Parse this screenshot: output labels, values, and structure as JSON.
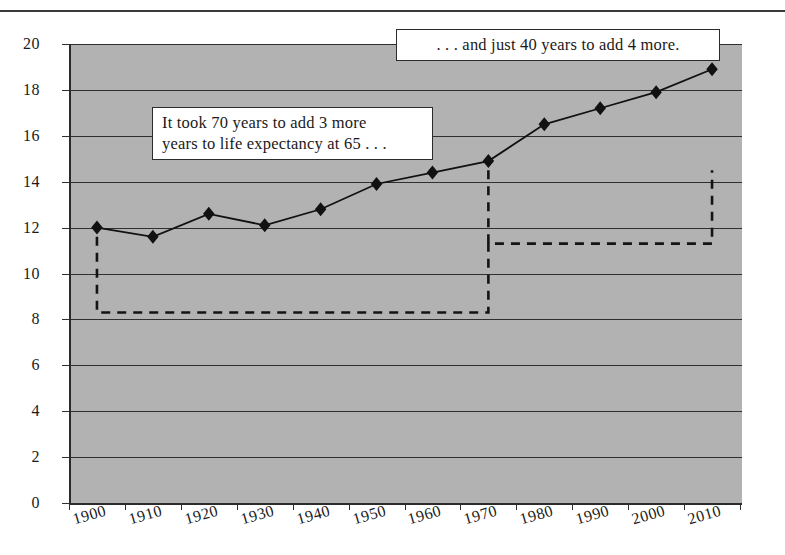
{
  "figure": {
    "has_top_rule": true,
    "plot_background": "#b2b2b2",
    "ink_color": "#2b2b2b"
  },
  "annotations": [
    {
      "id": "callout-1",
      "line1": "It took 70 years to add 3 more",
      "line2": "years to life expectancy at 65 . . ."
    },
    {
      "id": "callout-2",
      "line1": ". . . and just 40 years to add 4 more."
    }
  ],
  "chart_data": {
    "type": "line",
    "title": "",
    "subtitle": "",
    "xlabel": "",
    "ylabel": "",
    "categories": [
      "1900",
      "1910",
      "1920",
      "1930",
      "1940",
      "1950",
      "1960",
      "1970",
      "1980",
      "1990",
      "2000",
      "2010"
    ],
    "values": [
      12.0,
      11.6,
      12.6,
      12.1,
      12.8,
      13.9,
      14.4,
      14.9,
      16.5,
      17.2,
      17.9,
      18.9
    ],
    "series": [
      {
        "name": "Life expectancy at 65",
        "values": [
          12.0,
          11.6,
          12.6,
          12.1,
          12.8,
          13.9,
          14.4,
          14.9,
          16.5,
          17.2,
          17.9,
          18.9
        ],
        "marker": "diamond",
        "color": "#111111"
      }
    ],
    "ylim": [
      0,
      20
    ],
    "yticks": [
      0,
      2,
      4,
      6,
      8,
      10,
      12,
      14,
      16,
      18,
      20
    ],
    "ytick_labels": [
      "0",
      "2",
      "4",
      "6",
      "8",
      "10",
      "12",
      "14",
      "16",
      "18",
      "20"
    ],
    "xtick_labels": [
      "1900",
      "1910",
      "1920",
      "1930",
      "1940",
      "1950",
      "1960",
      "1970",
      "1980",
      "1990",
      "2000",
      "2010"
    ],
    "grid": "horizontal",
    "legend": "none",
    "brackets": [
      {
        "name": "bracket-1900-1970",
        "from_category": "1900",
        "to_category": "1970",
        "baseline_value": 8.3,
        "left_top_value": 11.6,
        "right_top_value": 11.6,
        "style": "dashed"
      },
      {
        "name": "bracket-1970-2010",
        "from_category": "1970",
        "to_category": "2010",
        "baseline_value": 11.3,
        "left_top_value": 14.5,
        "right_top_value": 14.5,
        "style": "dashed"
      }
    ]
  }
}
